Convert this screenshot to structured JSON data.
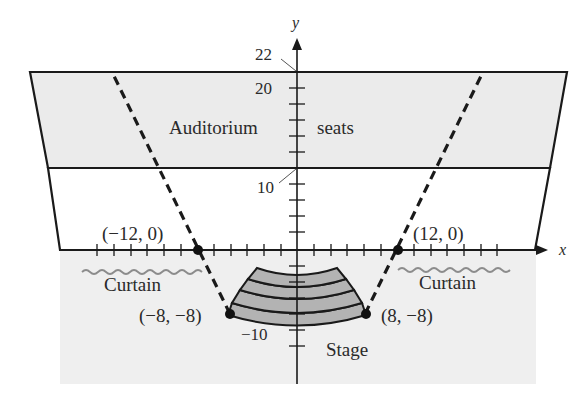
{
  "figure": {
    "type": "coordinate-diagram",
    "axes": {
      "x_label": "x",
      "y_label": "y",
      "y_tick_labels": {
        "top": "22",
        "upper": "20",
        "mid": "10",
        "bottom": "−10"
      }
    },
    "regions": {
      "auditorium_label_left": "Auditorium",
      "auditorium_label_right": "seats",
      "curtain_left": "Curtain",
      "curtain_right": "Curtain",
      "stage": "Stage"
    },
    "points": [
      {
        "label": "(−12, 0)",
        "x": -12,
        "y": 0
      },
      {
        "label": "(12, 0)",
        "x": 12,
        "y": 0
      },
      {
        "label": "(−8, −8)",
        "x": -8,
        "y": -8
      },
      {
        "label": "(8, −8)",
        "x": 8,
        "y": -8
      }
    ],
    "colors": {
      "seat_fill": "#ebebeb",
      "stage_area_fill": "#efefef",
      "stage_fill": "#b3b3b3",
      "line": "#1a1a1a",
      "curtain": "#8c8c8c"
    }
  }
}
